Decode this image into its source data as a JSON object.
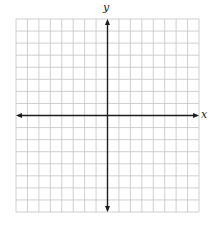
{
  "diagram": {
    "type": "coordinate-grid",
    "grid": {
      "columns": 16,
      "rows": 16,
      "left": 16,
      "top": 19,
      "right": 199,
      "bottom": 212,
      "line_color": "#c4c4c4",
      "background": "#ffffff"
    },
    "axes": {
      "color": "#1e1e1e",
      "origin_col": 8,
      "origin_row": 8,
      "x_label": "x",
      "y_label": "y",
      "arrows": [
        "left",
        "right",
        "up",
        "down"
      ]
    }
  }
}
